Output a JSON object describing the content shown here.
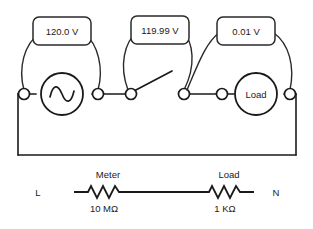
{
  "diagram": {
    "colors": {
      "background": "#ffffff",
      "line": "#1a1a1a",
      "arc": "#2a2a2a",
      "text": "#1a1a1a"
    },
    "meters": [
      {
        "id": "source-voltmeter",
        "reading": "120.0 V",
        "measures": "source"
      },
      {
        "id": "switch-voltmeter",
        "reading": "119.99 V",
        "measures": "open-switch"
      },
      {
        "id": "load-voltmeter",
        "reading": "0.01 V",
        "measures": "load"
      }
    ],
    "components": {
      "source": {
        "symbol": "ac-source-sine",
        "label": ""
      },
      "switch": {
        "symbol": "open-switch",
        "label": ""
      },
      "load": {
        "symbol": "load-circle",
        "label": "Load"
      }
    },
    "schematic": {
      "left_terminal_label": "L",
      "right_terminal_label": "N",
      "elements": [
        {
          "id": "meter-resistor",
          "name": "Meter",
          "value": "10 MΩ",
          "symbol": "resistor-zigzag"
        },
        {
          "id": "load-resistor",
          "name": "Load",
          "value": "1 KΩ",
          "symbol": "resistor-zigzag"
        }
      ]
    }
  }
}
